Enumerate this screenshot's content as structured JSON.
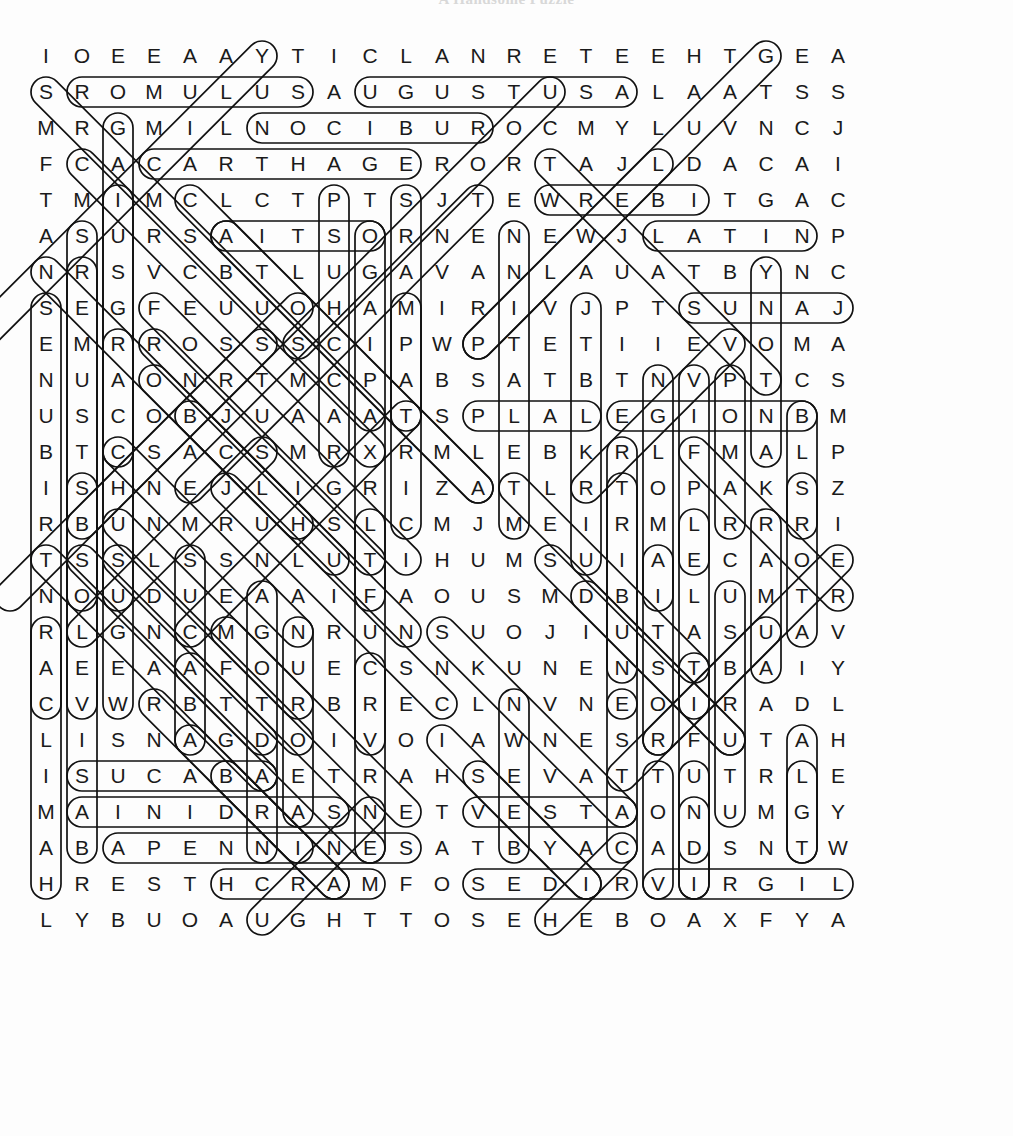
{
  "title": "A Handsome Puzzle",
  "puzzle": {
    "type": "word-search",
    "theme": "Ancient Rome",
    "rows": 25,
    "cols": 23,
    "cell_size": 36,
    "origin_x": 28,
    "origin_y": 38,
    "grid": [
      "IOEEAAYTICLANRETEEHTGEA",
      "SROMULUSAUGUSTUSALAATSS",
      "MRGMILNOCIBUROCMYLUVNCJ",
      "FCACARTHAGERORTAJLDACAI",
      "TMIMCLCTPTSJTEWREBITGAC",
      "ASURSAITSORNENEWJLATINP",
      "NRSVCBTLUGAVANLAUATBYNC",
      "SEGFEUUOHAMIRIVJPTSUNAJ",
      "EMRROSSSCIPWPTETIIEVOMA",
      "NUAONRTMCPABSATBTNVPTCS",
      "USCOBJUAAATSPLALEGIONBM",
      "BTCSACSMRXRMLEBKRLFMALP",
      "ISHNEJLIGRIZATLRTOPAKSZ",
      "RBUNMRUHSLCMJMEIRMLRRRI",
      "TSSLSSNLUTIHUMSUIAECAOE",
      "NOUDUEAAIFAOUSMDBILUMTR",
      "RLGNCMGNRUNSUOJIUTASUAV",
      "AEEAAFOUECSNKUNENSTBAIY",
      "CVWRBTTRBRECLNVNEOIRADL",
      "LISNAGDOIVOIAWNESRFUTAH",
      "ISUCABAETRAHSEVATTUTRLE",
      "MAINIDRASNETVESTAONUMGY",
      "ABAPENNINESATBYACADSNTW",
      "HRESTHCRAMFOSEDIRVIRGIL",
      "LYBUOAUGHTTOSEHEBOAXFYA"
    ],
    "found_words": [
      {
        "word": "ROMULUS",
        "row": 1,
        "col": 1,
        "dir": "E",
        "len": 7
      },
      {
        "word": "AUGUSTUS",
        "row": 1,
        "col": 9,
        "dir": "E",
        "len": 8
      },
      {
        "word": "RUBICON",
        "row": 2,
        "col": 12,
        "dir": "W",
        "len": 7
      },
      {
        "word": "CARTHAGE",
        "row": 3,
        "col": 3,
        "dir": "E",
        "len": 8
      },
      {
        "word": "TIBER",
        "row": 4,
        "col": 18,
        "dir": "W",
        "len": 5
      },
      {
        "word": "OSTIA",
        "row": 5,
        "col": 9,
        "dir": "W",
        "len": 5
      },
      {
        "word": "LATIN",
        "row": 5,
        "col": 17,
        "dir": "E",
        "len": 5
      },
      {
        "word": "JANUS",
        "row": 7,
        "col": 22,
        "dir": "W",
        "len": 5
      },
      {
        "word": "SPLA",
        "row": 10,
        "col": 12,
        "dir": "E",
        "len": 4
      },
      {
        "word": "LEGION",
        "row": 10,
        "col": 16,
        "dir": "E",
        "len": 6
      },
      {
        "word": "ABACUS",
        "row": 20,
        "col": 6,
        "dir": "W",
        "len": 6
      },
      {
        "word": "SARDINIA",
        "row": 21,
        "col": 8,
        "dir": "W",
        "len": 8
      },
      {
        "word": "APENNINES",
        "row": 22,
        "col": 2,
        "dir": "E",
        "len": 9
      },
      {
        "word": "VESTA",
        "row": 21,
        "col": 12,
        "dir": "E",
        "len": 5
      },
      {
        "word": "MARCH",
        "row": 23,
        "col": 9,
        "dir": "W",
        "len": 5
      },
      {
        "word": "RIDES",
        "row": 23,
        "col": 16,
        "dir": "W",
        "len": 5
      },
      {
        "word": "VIRGIL",
        "row": 23,
        "col": 17,
        "dir": "E",
        "len": 6
      }
    ],
    "colors": {
      "letter": "#1a1a1a",
      "mark_stroke": "#111111",
      "background": "#fdfdfd"
    }
  }
}
